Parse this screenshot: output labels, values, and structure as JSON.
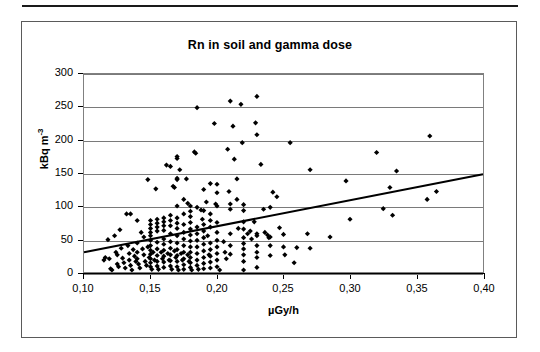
{
  "figure": {
    "title": "Rn in soil and gamma dose"
  },
  "chart_data": {
    "type": "scatter",
    "title": "Rn in soil and gamma dose",
    "xlabel": "µGy/h",
    "ylabel": "kBq m-3",
    "ylabel_base": "kBq m",
    "ylabel_exponent": "-3",
    "xlim": [
      0.1,
      0.4
    ],
    "ylim": [
      0,
      300
    ],
    "xticks": [
      0.1,
      0.15,
      0.2,
      0.25,
      0.3,
      0.35,
      0.4
    ],
    "xtick_labels": [
      "0,10",
      "0,15",
      "0,20",
      "0,25",
      "0,30",
      "0,35",
      "0,40"
    ],
    "yticks": [
      0,
      50,
      100,
      150,
      200,
      250,
      300
    ],
    "ytick_labels": [
      "0",
      "50",
      "100",
      "150",
      "200",
      "250",
      "300"
    ],
    "grid": "horizontal",
    "legend": "none",
    "marker": "diamond",
    "marker_color": "#000000",
    "series": [
      {
        "name": "Rn in soil vs gamma dose",
        "points": [
          [
            0.115,
            18
          ],
          [
            0.116,
            22
          ],
          [
            0.118,
            49
          ],
          [
            0.119,
            20
          ],
          [
            0.12,
            5
          ],
          [
            0.121,
            3
          ],
          [
            0.123,
            55
          ],
          [
            0.124,
            30
          ],
          [
            0.125,
            26
          ],
          [
            0.125,
            12
          ],
          [
            0.126,
            8
          ],
          [
            0.127,
            64
          ],
          [
            0.128,
            36
          ],
          [
            0.129,
            21
          ],
          [
            0.13,
            14
          ],
          [
            0.131,
            6
          ],
          [
            0.132,
            88
          ],
          [
            0.133,
            40
          ],
          [
            0.134,
            28
          ],
          [
            0.134,
            18
          ],
          [
            0.135,
            88
          ],
          [
            0.135,
            10
          ],
          [
            0.136,
            3
          ],
          [
            0.137,
            34
          ],
          [
            0.138,
            24
          ],
          [
            0.139,
            16
          ],
          [
            0.14,
            78
          ],
          [
            0.14,
            44
          ],
          [
            0.14,
            30
          ],
          [
            0.14,
            20
          ],
          [
            0.141,
            12
          ],
          [
            0.142,
            6
          ],
          [
            0.143,
            60
          ],
          [
            0.144,
            35
          ],
          [
            0.145,
            53
          ],
          [
            0.145,
            26
          ],
          [
            0.146,
            16
          ],
          [
            0.147,
            10
          ],
          [
            0.148,
            140
          ],
          [
            0.148,
            38
          ],
          [
            0.149,
            22
          ],
          [
            0.15,
            78
          ],
          [
            0.15,
            72
          ],
          [
            0.15,
            66
          ],
          [
            0.15,
            60
          ],
          [
            0.15,
            55
          ],
          [
            0.15,
            48
          ],
          [
            0.15,
            40
          ],
          [
            0.15,
            33
          ],
          [
            0.15,
            27
          ],
          [
            0.15,
            20
          ],
          [
            0.15,
            14
          ],
          [
            0.15,
            8
          ],
          [
            0.151,
            4
          ],
          [
            0.152,
            30
          ],
          [
            0.153,
            18
          ],
          [
            0.154,
            126
          ],
          [
            0.155,
            80
          ],
          [
            0.155,
            74
          ],
          [
            0.155,
            68
          ],
          [
            0.155,
            62
          ],
          [
            0.155,
            45
          ],
          [
            0.155,
            35
          ],
          [
            0.155,
            25
          ],
          [
            0.155,
            16
          ],
          [
            0.155,
            9
          ],
          [
            0.156,
            4
          ],
          [
            0.158,
            30
          ],
          [
            0.159,
            20
          ],
          [
            0.16,
            82
          ],
          [
            0.16,
            76
          ],
          [
            0.16,
            70
          ],
          [
            0.16,
            63
          ],
          [
            0.16,
            50
          ],
          [
            0.16,
            42
          ],
          [
            0.16,
            33
          ],
          [
            0.16,
            24
          ],
          [
            0.16,
            15
          ],
          [
            0.16,
            7
          ],
          [
            0.162,
            162
          ],
          [
            0.163,
            28
          ],
          [
            0.164,
            18
          ],
          [
            0.165,
            160
          ],
          [
            0.165,
            86
          ],
          [
            0.165,
            78
          ],
          [
            0.165,
            70
          ],
          [
            0.165,
            58
          ],
          [
            0.165,
            46
          ],
          [
            0.165,
            36
          ],
          [
            0.165,
            26
          ],
          [
            0.165,
            17
          ],
          [
            0.165,
            9
          ],
          [
            0.166,
            4
          ],
          [
            0.167,
            130
          ],
          [
            0.168,
            128
          ],
          [
            0.168,
            32
          ],
          [
            0.169,
            22
          ],
          [
            0.17,
            175
          ],
          [
            0.17,
            172
          ],
          [
            0.17,
            142
          ],
          [
            0.17,
            140
          ],
          [
            0.17,
            100
          ],
          [
            0.17,
            82
          ],
          [
            0.17,
            74
          ],
          [
            0.17,
            66
          ],
          [
            0.17,
            55
          ],
          [
            0.17,
            44
          ],
          [
            0.17,
            34
          ],
          [
            0.17,
            25
          ],
          [
            0.17,
            16
          ],
          [
            0.17,
            8
          ],
          [
            0.171,
            3
          ],
          [
            0.172,
            155
          ],
          [
            0.173,
            28
          ],
          [
            0.174,
            18
          ],
          [
            0.175,
            110
          ],
          [
            0.175,
            88
          ],
          [
            0.175,
            72
          ],
          [
            0.175,
            60
          ],
          [
            0.175,
            50
          ],
          [
            0.175,
            40
          ],
          [
            0.175,
            30
          ],
          [
            0.175,
            20
          ],
          [
            0.175,
            11
          ],
          [
            0.175,
            4
          ],
          [
            0.177,
            141
          ],
          [
            0.178,
            104
          ],
          [
            0.178,
            26
          ],
          [
            0.179,
            16
          ],
          [
            0.18,
            100
          ],
          [
            0.18,
            92
          ],
          [
            0.18,
            84
          ],
          [
            0.18,
            75
          ],
          [
            0.18,
            65
          ],
          [
            0.18,
            56
          ],
          [
            0.18,
            47
          ],
          [
            0.18,
            38
          ],
          [
            0.18,
            30
          ],
          [
            0.18,
            22
          ],
          [
            0.18,
            14
          ],
          [
            0.18,
            7
          ],
          [
            0.181,
            3
          ],
          [
            0.183,
            182
          ],
          [
            0.184,
            180
          ],
          [
            0.185,
            249
          ],
          [
            0.185,
            98
          ],
          [
            0.185,
            68
          ],
          [
            0.185,
            58
          ],
          [
            0.185,
            48
          ],
          [
            0.185,
            38
          ],
          [
            0.185,
            28
          ],
          [
            0.185,
            18
          ],
          [
            0.185,
            10
          ],
          [
            0.186,
            4
          ],
          [
            0.188,
            94
          ],
          [
            0.189,
            80
          ],
          [
            0.19,
            125
          ],
          [
            0.19,
            93
          ],
          [
            0.19,
            72
          ],
          [
            0.19,
            62
          ],
          [
            0.19,
            52
          ],
          [
            0.19,
            42
          ],
          [
            0.19,
            32
          ],
          [
            0.19,
            22
          ],
          [
            0.19,
            13
          ],
          [
            0.19,
            5
          ],
          [
            0.192,
            106
          ],
          [
            0.193,
            55
          ],
          [
            0.194,
            26
          ],
          [
            0.195,
            134
          ],
          [
            0.195,
            88
          ],
          [
            0.195,
            78
          ],
          [
            0.195,
            68
          ],
          [
            0.195,
            44
          ],
          [
            0.195,
            34
          ],
          [
            0.195,
            24
          ],
          [
            0.195,
            15
          ],
          [
            0.195,
            6
          ],
          [
            0.198,
            225
          ],
          [
            0.199,
            103
          ],
          [
            0.2,
            133
          ],
          [
            0.2,
            120
          ],
          [
            0.2,
            100
          ],
          [
            0.2,
            75
          ],
          [
            0.2,
            60
          ],
          [
            0.2,
            48
          ],
          [
            0.2,
            38
          ],
          [
            0.2,
            28
          ],
          [
            0.2,
            18
          ],
          [
            0.2,
            8
          ],
          [
            0.202,
            3
          ],
          [
            0.205,
            46
          ],
          [
            0.206,
            30
          ],
          [
            0.207,
            20
          ],
          [
            0.208,
            186
          ],
          [
            0.209,
            122
          ],
          [
            0.21,
            259
          ],
          [
            0.21,
            103
          ],
          [
            0.21,
            95
          ],
          [
            0.21,
            58
          ],
          [
            0.21,
            40
          ],
          [
            0.21,
            27
          ],
          [
            0.212,
            221
          ],
          [
            0.213,
            171
          ],
          [
            0.215,
            141
          ],
          [
            0.215,
            110
          ],
          [
            0.216,
            66
          ],
          [
            0.218,
            254
          ],
          [
            0.219,
            196
          ],
          [
            0.22,
            102
          ],
          [
            0.22,
            93
          ],
          [
            0.22,
            76
          ],
          [
            0.22,
            65
          ],
          [
            0.22,
            52
          ],
          [
            0.22,
            43
          ],
          [
            0.22,
            35
          ],
          [
            0.22,
            26
          ],
          [
            0.22,
            16
          ],
          [
            0.22,
            3
          ],
          [
            0.223,
            58
          ],
          [
            0.225,
            62
          ],
          [
            0.226,
            50
          ],
          [
            0.228,
            76
          ],
          [
            0.229,
            226
          ],
          [
            0.23,
            266
          ],
          [
            0.23,
            208
          ],
          [
            0.23,
            58
          ],
          [
            0.23,
            55
          ],
          [
            0.23,
            40
          ],
          [
            0.23,
            30
          ],
          [
            0.23,
            22
          ],
          [
            0.23,
            7
          ],
          [
            0.233,
            163
          ],
          [
            0.235,
            95
          ],
          [
            0.236,
            60
          ],
          [
            0.238,
            56
          ],
          [
            0.239,
            52
          ],
          [
            0.24,
            98
          ],
          [
            0.24,
            53
          ],
          [
            0.24,
            40
          ],
          [
            0.24,
            25
          ],
          [
            0.242,
            121
          ],
          [
            0.245,
            114
          ],
          [
            0.247,
            67
          ],
          [
            0.25,
            57
          ],
          [
            0.25,
            38
          ],
          [
            0.251,
            26
          ],
          [
            0.255,
            196
          ],
          [
            0.258,
            14
          ],
          [
            0.26,
            37
          ],
          [
            0.268,
            58
          ],
          [
            0.27,
            155
          ],
          [
            0.27,
            36
          ],
          [
            0.285,
            53
          ],
          [
            0.297,
            138
          ],
          [
            0.3,
            80
          ],
          [
            0.32,
            181
          ],
          [
            0.325,
            96
          ],
          [
            0.33,
            128
          ],
          [
            0.332,
            86
          ],
          [
            0.335,
            153
          ],
          [
            0.358,
            110
          ],
          [
            0.36,
            206
          ],
          [
            0.365,
            122
          ]
        ]
      }
    ],
    "trendline": {
      "x_start": 0.1,
      "y_start": 30,
      "x_end": 0.4,
      "y_end": 148,
      "color": "#000000"
    }
  }
}
